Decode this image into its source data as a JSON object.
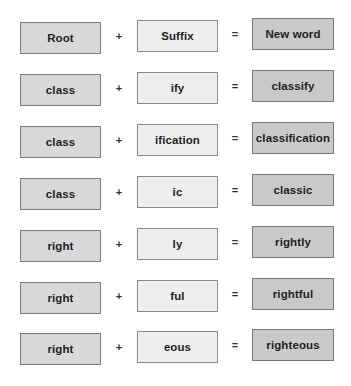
{
  "colors": {
    "root_fill": "#d8d8d8",
    "suffix_fill": "#efefef",
    "result_fill": "#c9c9c9",
    "border": "#7d7d7d",
    "text": "#1e1e1e"
  },
  "operators": {
    "plus": "+",
    "equals": "="
  },
  "rows": [
    {
      "root": "Root",
      "suffix": "Suffix",
      "result": "New word"
    },
    {
      "root": "class",
      "suffix": "ify",
      "result": "classify"
    },
    {
      "root": "class",
      "suffix": "ification",
      "result": "classification"
    },
    {
      "root": "class",
      "suffix": "ic",
      "result": "classic"
    },
    {
      "root": "right",
      "suffix": "ly",
      "result": "rightly"
    },
    {
      "root": "right",
      "suffix": "ful",
      "result": "rightful"
    },
    {
      "root": "right",
      "suffix": "eous",
      "result": "righteous"
    }
  ]
}
